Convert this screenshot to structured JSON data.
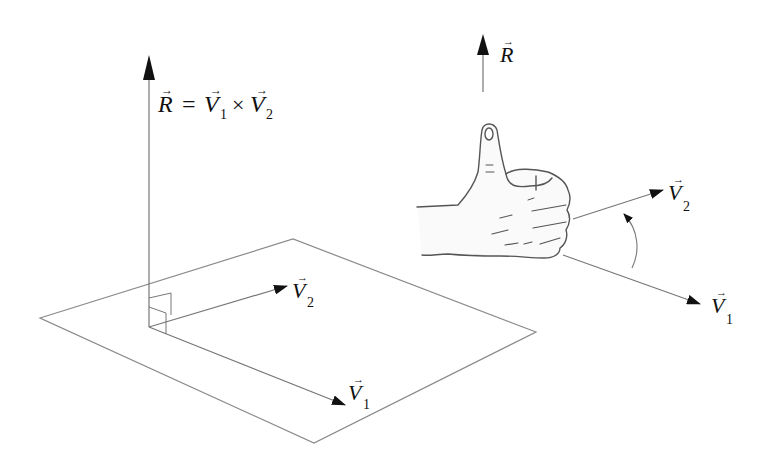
{
  "figure": {
    "left_panel": {
      "equation": {
        "lhs": "R",
        "equals": "=",
        "v1": "V",
        "v1_sub": "1",
        "times": "×",
        "v2": "V",
        "v2_sub": "2"
      },
      "plane": "parallelogram plane containing V1 and V2",
      "labels": {
        "v1": "V",
        "v1_sub": "1",
        "v2": "V",
        "v2_sub": "2"
      }
    },
    "right_panel": {
      "labels": {
        "r": "R",
        "v1": "V",
        "v1_sub": "1",
        "v2": "V",
        "v2_sub": "2"
      },
      "hand": "right hand thumbs-up, fingers curling from V1 toward V2",
      "rotation_arrow": "curved arrow from V1 to V2"
    },
    "colors": {
      "line": "#8a8a8a",
      "arrowhead": "#111111",
      "text": "#111111"
    }
  }
}
